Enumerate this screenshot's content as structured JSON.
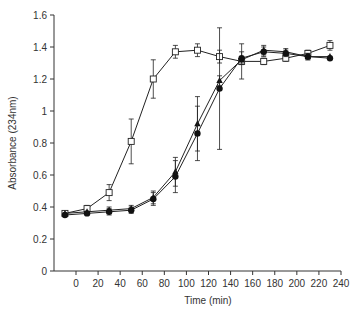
{
  "chart_data": {
    "type": "line",
    "title": "",
    "xlabel": "Time (min)",
    "ylabel": "Absorbance (234nm)",
    "xlim": [
      -20,
      240
    ],
    "ylim": [
      0,
      1.6
    ],
    "xticks": [
      0,
      20,
      40,
      60,
      80,
      100,
      120,
      140,
      160,
      180,
      200,
      220,
      240
    ],
    "yticks": [
      0,
      0.2,
      0.4,
      0.6,
      0.8,
      1,
      1.2,
      1.4,
      1.6
    ],
    "ytick_labels": [
      "0",
      "0.2",
      "0.4",
      "0.6",
      "0.8",
      "1",
      "1.2",
      "1.4",
      "1.6"
    ],
    "grid": false,
    "legend": null,
    "series": [
      {
        "name": "open-square",
        "marker": "square-open",
        "x": [
          -10,
          10,
          30,
          50,
          70,
          90,
          110,
          130,
          150,
          170,
          190,
          210,
          230
        ],
        "y": [
          0.36,
          0.39,
          0.49,
          0.81,
          1.2,
          1.37,
          1.38,
          1.34,
          1.31,
          1.31,
          1.33,
          1.36,
          1.41
        ],
        "err": [
          0.01,
          0.02,
          0.05,
          0.14,
          0.12,
          0.04,
          0.04,
          0.04,
          0.11,
          0.02,
          0.02,
          0.02,
          0.03
        ]
      },
      {
        "name": "filled-triangle",
        "marker": "triangle-filled",
        "x": [
          -10,
          10,
          30,
          50,
          70,
          90,
          110,
          130,
          150,
          170,
          190,
          210,
          230
        ],
        "y": [
          0.36,
          0.37,
          0.38,
          0.39,
          0.46,
          0.62,
          0.92,
          1.19,
          1.32,
          1.38,
          1.37,
          1.34,
          1.34
        ],
        "err": [
          0.01,
          0.01,
          0.02,
          0.02,
          0.04,
          0.09,
          0.17,
          0.03,
          0.02,
          0.03,
          0.02,
          0.02,
          0.01
        ]
      },
      {
        "name": "filled-circle",
        "marker": "circle-filled",
        "x": [
          -10,
          10,
          30,
          50,
          70,
          90,
          110,
          130,
          150,
          170,
          190,
          210,
          230
        ],
        "y": [
          0.35,
          0.36,
          0.37,
          0.38,
          0.45,
          0.59,
          0.86,
          1.14,
          1.33,
          1.37,
          1.36,
          1.34,
          1.33
        ],
        "err": [
          0.01,
          0.01,
          0.02,
          0.02,
          0.04,
          0.1,
          0.17,
          0.38,
          0.04,
          0.03,
          0.02,
          0.02,
          0.01
        ]
      }
    ]
  },
  "axes": {
    "x_label": "Time (min)",
    "y_label": "Absorbance (234nm)"
  }
}
